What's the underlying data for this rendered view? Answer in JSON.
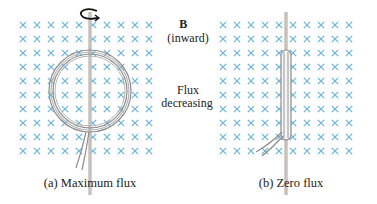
{
  "figure": {
    "field_label": "B⃗",
    "field_direction": "(inward)",
    "flux_label_line1": "Flux",
    "flux_label_line2": "decreasing",
    "panels": [
      {
        "id": "a",
        "caption": "(a) Maximum flux",
        "coil_orientation": "face-on"
      },
      {
        "id": "b",
        "caption": "(b) Zero flux",
        "coil_orientation": "edge-on"
      }
    ],
    "field_symbol": "×",
    "grid": {
      "rows": 10,
      "cols": 10
    },
    "colors": {
      "field_x": "#6ab4d8",
      "coil": "#9a9a9a",
      "rod": "#c8c0bc",
      "arrow": "#111111",
      "text": "#222222"
    }
  }
}
